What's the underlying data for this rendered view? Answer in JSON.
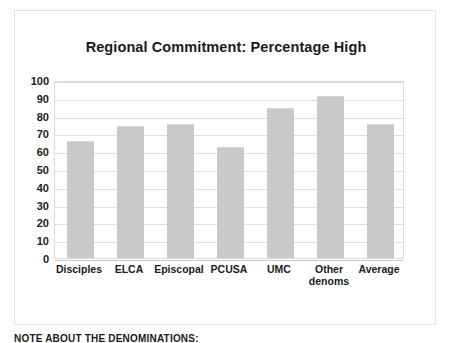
{
  "chart_data": {
    "type": "bar",
    "title": "Regional Commitment: Percentage High",
    "xlabel": "",
    "ylabel": "",
    "categories": [
      "Disciples",
      "ELCA",
      "Episcopal",
      "PCUSA",
      "UMC",
      "Other denoms",
      "Average"
    ],
    "values": [
      66,
      74,
      75.5,
      62.5,
      84,
      91,
      75
    ],
    "ylim": [
      0,
      100
    ],
    "ytick_labels": [
      "100",
      "90",
      "80",
      "70",
      "60",
      "50",
      "40",
      "30",
      "20",
      "10",
      "0"
    ],
    "ytick_values": [
      100,
      90,
      80,
      70,
      60,
      50,
      40,
      30,
      20,
      10,
      0
    ],
    "grid": true,
    "legend": null,
    "bar_color": "#c9c9c9",
    "grid_color": "#dfdfdf",
    "text_color": "#1b1b1b"
  },
  "category_lines": [
    [
      "Disciples"
    ],
    [
      "ELCA"
    ],
    [
      "Episcopal"
    ],
    [
      "PCUSA"
    ],
    [
      "UMC"
    ],
    [
      "Other",
      "denoms"
    ],
    [
      "Average"
    ]
  ],
  "footer": {
    "note": "NOTE ABOUT THE DENOMINATIONS:"
  }
}
